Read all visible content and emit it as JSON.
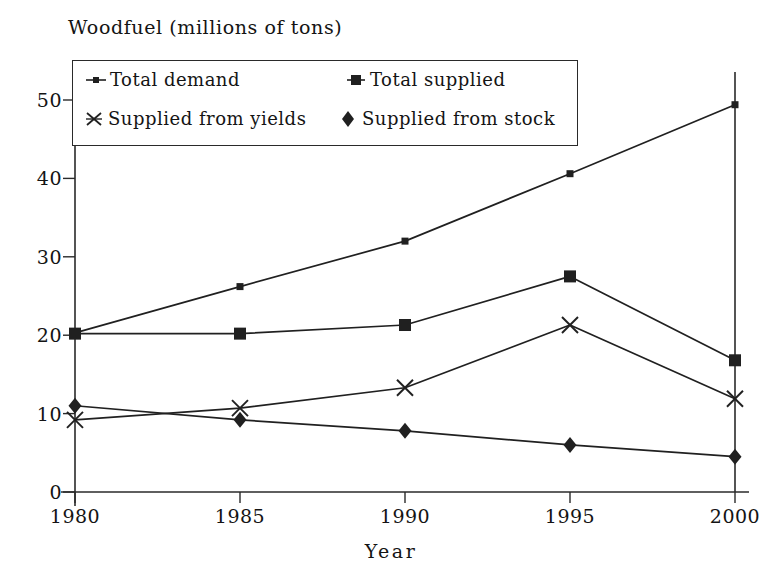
{
  "chart_data": {
    "type": "line",
    "title": "Woodfuel (millions of tons)",
    "xlabel": "Year",
    "ylabel": "",
    "categories": [
      "1980",
      "1985",
      "1990",
      "1995",
      "2000"
    ],
    "x": [
      1980,
      1985,
      1990,
      1995,
      2000
    ],
    "xlim": [
      1980,
      2000
    ],
    "ylim": [
      0,
      50
    ],
    "yticks": [
      0,
      10,
      20,
      30,
      40,
      50
    ],
    "xticks": [
      "1980",
      "1985",
      "1990",
      "1995",
      "2000"
    ],
    "grid": false,
    "legend_position": "upper-left-inside",
    "series": [
      {
        "name": "Total demand",
        "marker": "small-square",
        "values": [
          20.3,
          26.2,
          32.0,
          40.6,
          49.4
        ]
      },
      {
        "name": "Total supplied",
        "marker": "square",
        "values": [
          20.2,
          20.2,
          21.3,
          27.5,
          16.8
        ]
      },
      {
        "name": "Supplied from yields",
        "marker": "x-asterisk",
        "values": [
          9.2,
          10.7,
          13.3,
          21.3,
          11.9
        ]
      },
      {
        "name": "Supplied from stock",
        "marker": "diamond",
        "values": [
          11.0,
          9.2,
          7.8,
          6.0,
          4.5
        ]
      }
    ],
    "colors": {
      "line": "#202020",
      "axis": "#2a2a2a",
      "text": "#141414",
      "background": "#ffffff"
    }
  },
  "axis": {
    "y_tick_labels": [
      "50",
      "40",
      "30",
      "20",
      "10",
      "0"
    ],
    "x_tick_labels": [
      "1980",
      "1985",
      "1990",
      "1995",
      "2000"
    ],
    "x_axis_title": "Year"
  },
  "legend": {
    "entries": [
      {
        "label": "Total demand",
        "marker": "small-square-line"
      },
      {
        "label": "Total supplied",
        "marker": "square-line"
      },
      {
        "label": "Supplied from yields",
        "marker": "x-asterisk"
      },
      {
        "label": "Supplied from stock",
        "marker": "diamond"
      }
    ]
  }
}
